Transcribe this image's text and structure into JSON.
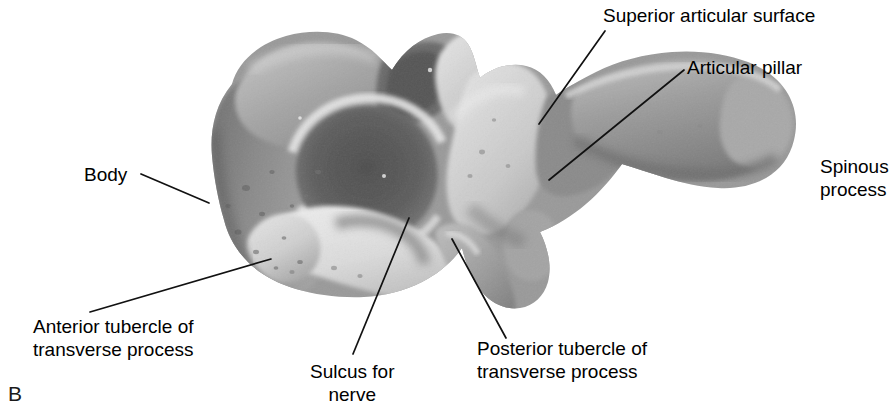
{
  "figure": {
    "panel_letter": "B",
    "background_color": "#ffffff",
    "text_color": "#000000",
    "leader_line_color": "#111111"
  },
  "labels": [
    {
      "id": "body",
      "text": "Body",
      "x": 84,
      "y": 163,
      "align": "left",
      "leader": {
        "x1": 141,
        "y1": 174,
        "x2": 209,
        "y2": 203
      }
    },
    {
      "id": "superior-articular-surface",
      "text": "Superior articular surface",
      "x": 603,
      "y": 4,
      "align": "left",
      "leader": {
        "x1": 605,
        "y1": 31,
        "x2": 539,
        "y2": 124
      }
    },
    {
      "id": "articular-pillar",
      "text": "Articular pillar",
      "x": 687,
      "y": 56,
      "align": "left",
      "leader": {
        "x1": 684,
        "y1": 70,
        "x2": 549,
        "y2": 180
      }
    },
    {
      "id": "spinous-process",
      "text": "Spinous\nprocess",
      "x": 820,
      "y": 155,
      "align": "left",
      "leader": null
    },
    {
      "id": "anterior-tubercle-of-transverse-process",
      "text": "Anterior tubercle of\ntransverse process",
      "x": 33,
      "y": 315,
      "align": "left",
      "leader": {
        "x1": 90,
        "y1": 312,
        "x2": 271,
        "y2": 259
      }
    },
    {
      "id": "sulcus-for-nerve",
      "text": "Sulcus for\nnerve",
      "x": 310,
      "y": 360,
      "align": "center",
      "leader": {
        "x1": 353,
        "y1": 354,
        "x2": 409,
        "y2": 218
      }
    },
    {
      "id": "posterior-tubercle-of-transverse-process",
      "text": "Posterior tubercle of\ntransverse process",
      "x": 477,
      "y": 337,
      "align": "left",
      "leader": {
        "x1": 506,
        "y1": 338,
        "x2": 452,
        "y2": 239
      }
    }
  ]
}
